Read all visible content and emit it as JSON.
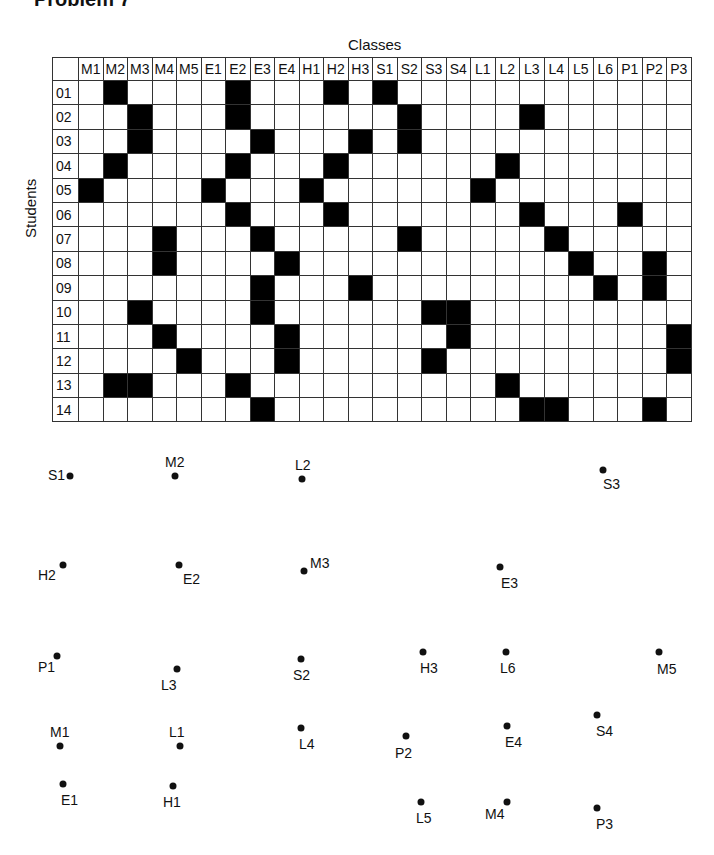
{
  "title": "Problem 7",
  "grid": {
    "x_axis_label": "Classes",
    "y_axis_label": "Students",
    "classes": [
      "M1",
      "M2",
      "M3",
      "M4",
      "M5",
      "E1",
      "E2",
      "E3",
      "E4",
      "H1",
      "H2",
      "H3",
      "S1",
      "S2",
      "S3",
      "S4",
      "L1",
      "L2",
      "L3",
      "L4",
      "L5",
      "L6",
      "P1",
      "P2",
      "P3"
    ],
    "students": [
      {
        "id": "01",
        "classes": [
          "M2",
          "E2",
          "H2",
          "S1"
        ]
      },
      {
        "id": "02",
        "classes": [
          "M3",
          "E2",
          "S2",
          "L3"
        ]
      },
      {
        "id": "03",
        "classes": [
          "M3",
          "E3",
          "H3",
          "S2"
        ]
      },
      {
        "id": "04",
        "classes": [
          "M2",
          "E2",
          "H2",
          "L2"
        ]
      },
      {
        "id": "05",
        "classes": [
          "M1",
          "E1",
          "H1",
          "L1"
        ]
      },
      {
        "id": "06",
        "classes": [
          "E2",
          "H2",
          "L3",
          "P1"
        ]
      },
      {
        "id": "07",
        "classes": [
          "M4",
          "E3",
          "S2",
          "L4"
        ]
      },
      {
        "id": "08",
        "classes": [
          "M4",
          "E4",
          "L5",
          "P2"
        ]
      },
      {
        "id": "09",
        "classes": [
          "E3",
          "H3",
          "L6",
          "P2"
        ]
      },
      {
        "id": "10",
        "classes": [
          "M3",
          "E3",
          "S3",
          "S4"
        ]
      },
      {
        "id": "11",
        "classes": [
          "M4",
          "E4",
          "S4",
          "P3"
        ]
      },
      {
        "id": "12",
        "classes": [
          "M5",
          "E4",
          "S3",
          "P3"
        ]
      },
      {
        "id": "13",
        "classes": [
          "M2",
          "M3",
          "E2",
          "L2"
        ]
      },
      {
        "id": "14",
        "classes": [
          "E3",
          "L3",
          "L4",
          "P2"
        ]
      }
    ]
  },
  "graph_nodes": [
    {
      "label": "S1",
      "x": 70,
      "y": 476,
      "lx": -22,
      "ly": -9
    },
    {
      "label": "M2",
      "x": 175,
      "y": 476,
      "lx": -10,
      "ly": -22
    },
    {
      "label": "L2",
      "x": 302,
      "y": 479,
      "lx": -7,
      "ly": -22
    },
    {
      "label": "S3",
      "x": 603,
      "y": 470,
      "lx": 0,
      "ly": 6
    },
    {
      "label": "H2",
      "x": 63,
      "y": 565,
      "lx": -25,
      "ly": 2
    },
    {
      "label": "E2",
      "x": 179,
      "y": 565,
      "lx": 4,
      "ly": 6
    },
    {
      "label": "M3",
      "x": 304,
      "y": 571,
      "lx": 6,
      "ly": -16
    },
    {
      "label": "E3",
      "x": 500,
      "y": 567,
      "lx": 1,
      "ly": 8
    },
    {
      "label": "P1",
      "x": 57,
      "y": 656,
      "lx": -19,
      "ly": 3
    },
    {
      "label": "L3",
      "x": 177,
      "y": 669,
      "lx": -16,
      "ly": 8
    },
    {
      "label": "S2",
      "x": 301,
      "y": 659,
      "lx": -8,
      "ly": 8
    },
    {
      "label": "H3",
      "x": 423,
      "y": 652,
      "lx": -3,
      "ly": 8
    },
    {
      "label": "L6",
      "x": 506,
      "y": 652,
      "lx": -6,
      "ly": 8
    },
    {
      "label": "M5",
      "x": 659,
      "y": 652,
      "lx": -2,
      "ly": 9
    },
    {
      "label": "M1",
      "x": 60,
      "y": 746,
      "lx": -10,
      "ly": -22
    },
    {
      "label": "L1",
      "x": 180,
      "y": 746,
      "lx": -11,
      "ly": -22
    },
    {
      "label": "L4",
      "x": 301,
      "y": 728,
      "lx": -2,
      "ly": 8
    },
    {
      "label": "P2",
      "x": 406,
      "y": 736,
      "lx": -11,
      "ly": 9
    },
    {
      "label": "E4",
      "x": 507,
      "y": 726,
      "lx": -2,
      "ly": 8
    },
    {
      "label": "S4",
      "x": 597,
      "y": 715,
      "lx": -1,
      "ly": 8
    },
    {
      "label": "E1",
      "x": 63,
      "y": 784,
      "lx": -2,
      "ly": 8
    },
    {
      "label": "H1",
      "x": 173,
      "y": 786,
      "lx": -10,
      "ly": 8
    },
    {
      "label": "L5",
      "x": 421,
      "y": 802,
      "lx": -5,
      "ly": 8
    },
    {
      "label": "M4",
      "x": 507,
      "y": 802,
      "lx": -22,
      "ly": 4
    },
    {
      "label": "P3",
      "x": 597,
      "y": 808,
      "lx": -1,
      "ly": 8
    }
  ]
}
